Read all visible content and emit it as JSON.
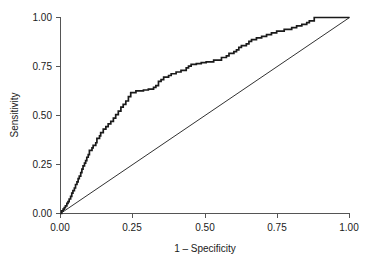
{
  "chart_data": {
    "type": "line",
    "title": "",
    "subtitle": "",
    "xlabel": "1 – Specificity",
    "ylabel": "Sensitivity",
    "xlim": [
      0.0,
      1.0
    ],
    "ylim": [
      0.0,
      1.0
    ],
    "grid": false,
    "legend": null,
    "x_tick_labels": [
      "0.00",
      "0.25",
      "0.50",
      "0.75",
      "1.00"
    ],
    "y_tick_labels": [
      "0.00",
      "0.25",
      "0.50",
      "0.75",
      "1.00"
    ],
    "x_tick_values": [
      0.0,
      0.25,
      0.5,
      0.75,
      1.0
    ],
    "y_tick_values": [
      0.0,
      0.25,
      0.5,
      0.75,
      1.0
    ],
    "series": [
      {
        "name": "ROC curve",
        "kind": "step",
        "color": "#1a1a1a",
        "x": [
          0.0,
          0.004,
          0.004,
          0.009,
          0.009,
          0.013,
          0.013,
          0.017,
          0.017,
          0.022,
          0.022,
          0.026,
          0.026,
          0.03,
          0.03,
          0.035,
          0.035,
          0.039,
          0.039,
          0.043,
          0.043,
          0.048,
          0.048,
          0.052,
          0.052,
          0.057,
          0.057,
          0.061,
          0.061,
          0.065,
          0.065,
          0.07,
          0.07,
          0.074,
          0.074,
          0.078,
          0.078,
          0.083,
          0.083,
          0.087,
          0.087,
          0.091,
          0.091,
          0.096,
          0.096,
          0.1,
          0.1,
          0.109,
          0.109,
          0.113,
          0.113,
          0.122,
          0.122,
          0.126,
          0.126,
          0.135,
          0.135,
          0.139,
          0.139,
          0.148,
          0.148,
          0.157,
          0.157,
          0.165,
          0.165,
          0.174,
          0.174,
          0.183,
          0.183,
          0.191,
          0.191,
          0.2,
          0.2,
          0.209,
          0.209,
          0.217,
          0.217,
          0.226,
          0.226,
          0.235,
          0.235,
          0.243,
          0.243,
          0.261,
          0.261,
          0.287,
          0.287,
          0.304,
          0.304,
          0.322,
          0.322,
          0.33,
          0.33,
          0.339,
          0.339,
          0.348,
          0.348,
          0.357,
          0.357,
          0.374,
          0.374,
          0.383,
          0.383,
          0.4,
          0.4,
          0.417,
          0.417,
          0.435,
          0.435,
          0.443,
          0.443,
          0.452,
          0.452,
          0.47,
          0.47,
          0.487,
          0.487,
          0.504,
          0.504,
          0.53,
          0.53,
          0.557,
          0.557,
          0.574,
          0.574,
          0.583,
          0.583,
          0.6,
          0.6,
          0.609,
          0.609,
          0.617,
          0.617,
          0.626,
          0.626,
          0.643,
          0.643,
          0.652,
          0.652,
          0.661,
          0.661,
          0.678,
          0.678,
          0.696,
          0.696,
          0.713,
          0.713,
          0.73,
          0.73,
          0.748,
          0.748,
          0.774,
          0.774,
          0.8,
          0.8,
          0.817,
          0.817,
          0.835,
          0.835,
          0.852,
          0.852,
          0.861,
          0.861,
          0.878,
          0.878,
          1.0
        ],
        "y": [
          0.0,
          0.0,
          0.013,
          0.013,
          0.022,
          0.022,
          0.03,
          0.03,
          0.039,
          0.039,
          0.052,
          0.052,
          0.061,
          0.061,
          0.074,
          0.074,
          0.087,
          0.087,
          0.104,
          0.104,
          0.117,
          0.117,
          0.13,
          0.13,
          0.148,
          0.148,
          0.161,
          0.161,
          0.178,
          0.178,
          0.191,
          0.191,
          0.209,
          0.209,
          0.226,
          0.226,
          0.243,
          0.243,
          0.257,
          0.257,
          0.27,
          0.27,
          0.287,
          0.287,
          0.3,
          0.3,
          0.322,
          0.322,
          0.335,
          0.335,
          0.348,
          0.348,
          0.361,
          0.361,
          0.383,
          0.383,
          0.396,
          0.396,
          0.413,
          0.413,
          0.43,
          0.43,
          0.443,
          0.443,
          0.457,
          0.457,
          0.47,
          0.47,
          0.487,
          0.487,
          0.504,
          0.504,
          0.522,
          0.522,
          0.543,
          0.543,
          0.557,
          0.557,
          0.574,
          0.574,
          0.596,
          0.596,
          0.617,
          0.617,
          0.626,
          0.626,
          0.63,
          0.63,
          0.635,
          0.635,
          0.643,
          0.643,
          0.652,
          0.652,
          0.674,
          0.674,
          0.683,
          0.683,
          0.696,
          0.696,
          0.704,
          0.704,
          0.713,
          0.713,
          0.722,
          0.722,
          0.73,
          0.73,
          0.743,
          0.743,
          0.752,
          0.752,
          0.761,
          0.761,
          0.765,
          0.765,
          0.77,
          0.77,
          0.774,
          0.774,
          0.783,
          0.783,
          0.796,
          0.796,
          0.804,
          0.804,
          0.817,
          0.817,
          0.826,
          0.826,
          0.835,
          0.835,
          0.848,
          0.848,
          0.857,
          0.857,
          0.865,
          0.865,
          0.878,
          0.878,
          0.887,
          0.887,
          0.896,
          0.896,
          0.904,
          0.904,
          0.913,
          0.913,
          0.922,
          0.922,
          0.93,
          0.93,
          0.939,
          0.939,
          0.948,
          0.948,
          0.957,
          0.957,
          0.965,
          0.965,
          0.974,
          0.974,
          0.983,
          0.983,
          1.0,
          1.0
        ]
      },
      {
        "name": "Reference diagonal",
        "kind": "line",
        "color": "#1a1a1a",
        "x": [
          0.0,
          1.0
        ],
        "y": [
          0.0,
          1.0
        ]
      }
    ]
  }
}
